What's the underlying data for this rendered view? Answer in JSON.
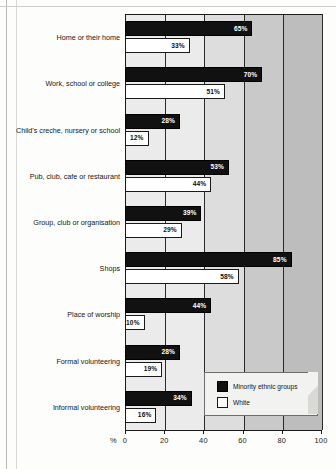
{
  "chart_data": {
    "type": "bar",
    "orientation": "horizontal",
    "title": "",
    "xlabel": "%",
    "ylabel": "",
    "xlim": [
      0,
      100
    ],
    "grid": true,
    "legend_position": "bottom-right",
    "categories": [
      "Home or their home",
      "Work, school or college",
      "Child's creche, nursery or school",
      "Pub, club, cafe or restaurant",
      "Group, club or organisation",
      "Shops",
      "Place of worship",
      "Formal volunteering",
      "Informal volunteering"
    ],
    "series": [
      {
        "name": "Minority ethnic groups",
        "color": "#111111",
        "values": [
          65,
          70,
          28,
          53,
          39,
          85,
          44,
          28,
          34
        ],
        "labels": [
          "65%",
          "70%",
          "28%",
          "53%",
          "39%",
          "85%",
          "44%",
          "28%",
          "34%"
        ]
      },
      {
        "name": "White",
        "color": "#ffffff",
        "values": [
          33,
          51,
          12,
          44,
          29,
          58,
          10,
          19,
          16
        ],
        "labels": [
          "33%",
          "51%",
          "12%",
          "44%",
          "29%",
          "58%",
          "10%",
          "19%",
          "16%"
        ]
      }
    ],
    "xticks": [
      0,
      20,
      40,
      60,
      80,
      100
    ],
    "xticklabels": [
      "0",
      "20",
      "40",
      "60",
      "80",
      "100"
    ]
  },
  "legend": {
    "items": [
      {
        "label": "Minority ethnic groups",
        "swatch": "dark"
      },
      {
        "label": "White",
        "swatch": "light"
      }
    ]
  },
  "axis": {
    "unit_label": "%"
  }
}
